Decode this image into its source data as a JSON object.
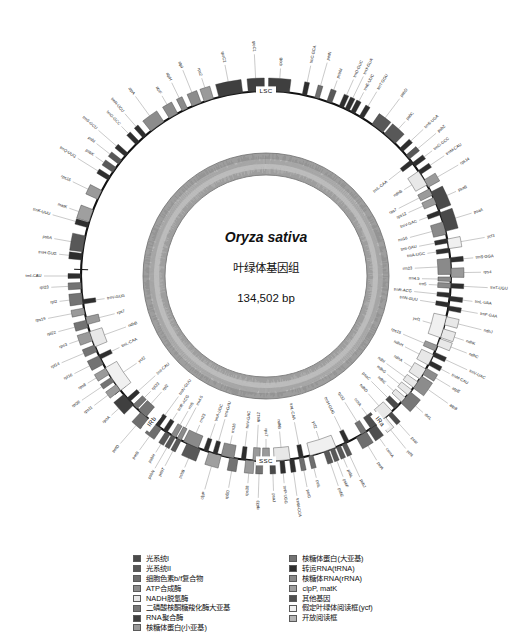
{
  "figure": {
    "species": "Oryza sativa",
    "subtitle": "叶绿体基因组",
    "genome_size": "134,502 bp",
    "regions": [
      {
        "name": "LSC",
        "label": "LSC"
      },
      {
        "name": "SSC",
        "label": "SSC"
      },
      {
        "name": "IRa",
        "label": "IRa"
      },
      {
        "name": "IRb",
        "label": "IRb"
      }
    ]
  },
  "legend": {
    "left": [
      {
        "label": "光系统I",
        "color": "#4a4a4a"
      },
      {
        "label": "光系统II",
        "color": "#585858"
      },
      {
        "label": "细胞色素b/f复合物",
        "color": "#6e6e6e"
      },
      {
        "label": "ATP合成酶",
        "color": "#8c8c8c"
      },
      {
        "label": "NADH脱氢酶",
        "color": "#e8e8e8"
      },
      {
        "label": "二磷酸核酮糖羧化酶大亚基",
        "color": "#777777"
      },
      {
        "label": "RNA聚合酶",
        "color": "#3f3f3f"
      },
      {
        "label": "核糖体蛋白(小亚基)",
        "color": "#9a9a9a"
      }
    ],
    "right": [
      {
        "label": "核糖体蛋白(大亚基)",
        "color": "#737373"
      },
      {
        "label": "转运RNA(tRNA)",
        "color": "#2e2e2e"
      },
      {
        "label": "核糖体RNA(rRNA)",
        "color": "#8a8a8a"
      },
      {
        "label": "clpP, matK",
        "color": "#9f9f9f"
      },
      {
        "label": "其他基因",
        "color": "#4f4f4f"
      },
      {
        "label": "假定叶绿体阅读框(ycf)",
        "color": "#f0f0f0"
      },
      {
        "label": "开放阅读框",
        "color": "#b4b4b4"
      }
    ]
  },
  "chart_data": {
    "type": "circular-genome-map",
    "total_bp": 134502,
    "rings": [
      "gene-track-outer",
      "gene-track-inner",
      "gc-content"
    ],
    "region_boundaries_deg": [
      272,
      104,
      196,
      232
    ],
    "genes_outside": [
      {
        "name": "trnH-GUG",
        "deg": 276,
        "color": "#2e2e2e",
        "w": 2.0
      },
      {
        "name": "psbA",
        "deg": 280,
        "color": "#585858",
        "w": 5.0
      },
      {
        "name": "trnK-UUU",
        "deg": 286,
        "color": "#2e2e2e",
        "w": 1.6
      },
      {
        "name": "matK",
        "deg": 289,
        "color": "#9f9f9f",
        "w": 4.0
      },
      {
        "name": "rps16",
        "deg": 296,
        "color": "#9a9a9a",
        "w": 3.0
      },
      {
        "name": "trnQ-UUG",
        "deg": 302,
        "color": "#2e2e2e",
        "w": 1.4
      },
      {
        "name": "psbK",
        "deg": 305,
        "color": "#585858",
        "w": 1.8
      },
      {
        "name": "psbI",
        "deg": 308,
        "color": "#585858",
        "w": 1.6
      },
      {
        "name": "trnS-GCU",
        "deg": 311,
        "color": "#2e2e2e",
        "w": 1.4
      },
      {
        "name": "trnG-GCC",
        "deg": 316,
        "color": "#2e2e2e",
        "w": 1.4
      },
      {
        "name": "trnR-UCU",
        "deg": 319,
        "color": "#2e2e2e",
        "w": 1.4
      },
      {
        "name": "atpA",
        "deg": 324,
        "color": "#8c8c8c",
        "w": 5.0
      },
      {
        "name": "atpF",
        "deg": 330,
        "color": "#8c8c8c",
        "w": 3.0
      },
      {
        "name": "atpH",
        "deg": 334,
        "color": "#8c8c8c",
        "w": 1.8
      },
      {
        "name": "atpI",
        "deg": 338,
        "color": "#8c8c8c",
        "w": 3.0
      },
      {
        "name": "rps2",
        "deg": 342,
        "color": "#9a9a9a",
        "w": 3.0
      },
      {
        "name": "rpoC2",
        "deg": 349,
        "color": "#3f3f3f",
        "w": 7.5
      },
      {
        "name": "rpoC1",
        "deg": 357,
        "color": "#3f3f3f",
        "w": 5.0
      },
      {
        "name": "rpoB",
        "deg": 4,
        "color": "#3f3f3f",
        "w": 6.5
      },
      {
        "name": "trnC-GCA",
        "deg": 12,
        "color": "#2e2e2e",
        "w": 1.4
      },
      {
        "name": "petN",
        "deg": 16,
        "color": "#6e6e6e",
        "w": 1.4
      },
      {
        "name": "psbM",
        "deg": 20,
        "color": "#585858",
        "w": 1.6
      },
      {
        "name": "trnD-GUC",
        "deg": 24,
        "color": "#2e2e2e",
        "w": 1.4
      },
      {
        "name": "trnY-GUA",
        "deg": 26,
        "color": "#2e2e2e",
        "w": 1.4
      },
      {
        "name": "trnE-UUC",
        "deg": 28,
        "color": "#2e2e2e",
        "w": 1.4
      },
      {
        "name": "trnT-GGU",
        "deg": 31,
        "color": "#2e2e2e",
        "w": 1.4
      },
      {
        "name": "psbD",
        "deg": 37,
        "color": "#585858",
        "w": 4.2
      },
      {
        "name": "psbC",
        "deg": 42,
        "color": "#585858",
        "w": 4.5
      },
      {
        "name": "trnS-UGA",
        "deg": 47,
        "color": "#2e2e2e",
        "w": 1.4
      },
      {
        "name": "psbZ",
        "deg": 50,
        "color": "#585858",
        "w": 1.6
      },
      {
        "name": "trnG-GCC",
        "deg": 53,
        "color": "#2e2e2e",
        "w": 1.4
      },
      {
        "name": "trnM-CAU",
        "deg": 56,
        "color": "#2e2e2e",
        "w": 1.4
      },
      {
        "name": "rps14",
        "deg": 60,
        "color": "#9a9a9a",
        "w": 2.6
      },
      {
        "name": "psaB",
        "deg": 66,
        "color": "#4a4a4a",
        "w": 6.0
      },
      {
        "name": "psaA",
        "deg": 73,
        "color": "#4a4a4a",
        "w": 6.0
      },
      {
        "name": "ycf3",
        "deg": 80,
        "color": "#f0f0f0",
        "w": 3.0
      },
      {
        "name": "trnS-GGA",
        "deg": 85,
        "color": "#2e2e2e",
        "w": 1.4
      },
      {
        "name": "rps4",
        "deg": 89,
        "color": "#9a9a9a",
        "w": 2.8
      },
      {
        "name": "trnT-UGU",
        "deg": 93,
        "color": "#2e2e2e",
        "w": 1.4
      },
      {
        "name": "trnL-UAA",
        "deg": 97,
        "color": "#2e2e2e",
        "w": 1.4
      },
      {
        "name": "trnF-GAA",
        "deg": 100,
        "color": "#2e2e2e",
        "w": 1.4
      },
      {
        "name": "ndhJ",
        "deg": 104,
        "color": "#e8e8e8",
        "w": 2.6
      },
      {
        "name": "ndhK",
        "deg": 108,
        "color": "#e8e8e8",
        "w": 2.8
      },
      {
        "name": "ndhC",
        "deg": 111,
        "color": "#e8e8e8",
        "w": 2.4
      },
      {
        "name": "trnV-UAC",
        "deg": 115,
        "color": "#2e2e2e",
        "w": 1.4
      },
      {
        "name": "trnM-CAU",
        "deg": 118,
        "color": "#2e2e2e",
        "w": 1.4
      },
      {
        "name": "atpE",
        "deg": 121,
        "color": "#8c8c8c",
        "w": 2.2
      },
      {
        "name": "atpB",
        "deg": 125,
        "color": "#8c8c8c",
        "w": 4.5
      },
      {
        "name": "rbcL",
        "deg": 131,
        "color": "#777777",
        "w": 4.5
      },
      {
        "name": "psaI",
        "deg": 138,
        "color": "#4a4a4a",
        "w": 1.4
      },
      {
        "name": "ycf4",
        "deg": 141,
        "color": "#f0f0f0",
        "w": 2.4
      },
      {
        "name": "cemA",
        "deg": 145,
        "color": "#4f4f4f",
        "w": 2.8
      },
      {
        "name": "petA",
        "deg": 149,
        "color": "#6e6e6e",
        "w": 3.6
      },
      {
        "name": "psbJ",
        "deg": 155,
        "color": "#585858",
        "w": 1.4
      },
      {
        "name": "psbL",
        "deg": 157,
        "color": "#585858",
        "w": 1.4
      },
      {
        "name": "psbF",
        "deg": 159,
        "color": "#585858",
        "w": 1.4
      },
      {
        "name": "psbE",
        "deg": 161,
        "color": "#585858",
        "w": 1.6
      },
      {
        "name": "petL",
        "deg": 166,
        "color": "#6e6e6e",
        "w": 1.4
      },
      {
        "name": "petG",
        "deg": 169,
        "color": "#6e6e6e",
        "w": 1.4
      },
      {
        "name": "trnW-CCA",
        "deg": 172,
        "color": "#2e2e2e",
        "w": 1.4
      },
      {
        "name": "trnP-UGG",
        "deg": 175,
        "color": "#2e2e2e",
        "w": 1.4
      },
      {
        "name": "psaJ",
        "deg": 178,
        "color": "#4a4a4a",
        "w": 1.6
      },
      {
        "name": "rpl33",
        "deg": 182,
        "color": "#737373",
        "w": 2.0
      },
      {
        "name": "rps18",
        "deg": 185,
        "color": "#9a9a9a",
        "w": 2.6
      },
      {
        "name": "rpl20",
        "deg": 190,
        "color": "#737373",
        "w": 2.6
      },
      {
        "name": "clpP",
        "deg": 196,
        "color": "#9f9f9f",
        "w": 4.0
      },
      {
        "name": "psbB",
        "deg": 203,
        "color": "#585858",
        "w": 4.5
      },
      {
        "name": "psbT",
        "deg": 208,
        "color": "#585858",
        "w": 1.4
      },
      {
        "name": "psbN",
        "deg": 210,
        "color": "#585858",
        "w": 1.4
      },
      {
        "name": "psbH",
        "deg": 212,
        "color": "#585858",
        "w": 1.6
      },
      {
        "name": "petB",
        "deg": 216,
        "color": "#6e6e6e",
        "w": 3.2
      },
      {
        "name": "petD",
        "deg": 221,
        "color": "#6e6e6e",
        "w": 3.2
      },
      {
        "name": "rpoA",
        "deg": 228,
        "color": "#3f3f3f",
        "w": 4.5
      },
      {
        "name": "rps11",
        "deg": 233,
        "color": "#9a9a9a",
        "w": 2.2
      },
      {
        "name": "rpl36",
        "deg": 236,
        "color": "#737373",
        "w": 1.6
      },
      {
        "name": "rps8",
        "deg": 239,
        "color": "#9a9a9a",
        "w": 2.2
      },
      {
        "name": "rpl16",
        "deg": 243,
        "color": "#737373",
        "w": 3.0
      },
      {
        "name": "rpl14",
        "deg": 247,
        "color": "#737373",
        "w": 2.2
      },
      {
        "name": "rps3",
        "deg": 251,
        "color": "#9a9a9a",
        "w": 3.0
      },
      {
        "name": "rpl22",
        "deg": 255,
        "color": "#737373",
        "w": 2.4
      },
      {
        "name": "rps19",
        "deg": 259,
        "color": "#9a9a9a",
        "w": 2.0
      },
      {
        "name": "rpl2",
        "deg": 263,
        "color": "#737373",
        "w": 3.4
      },
      {
        "name": "rpl23",
        "deg": 267,
        "color": "#737373",
        "w": 2.0
      },
      {
        "name": "trnI-CAU",
        "deg": 270,
        "color": "#2e2e2e",
        "w": 1.4
      }
    ],
    "genes_inside": [
      {
        "name": "trnV-GUG",
        "deg": 262,
        "color": "#2e2e2e",
        "w": 1.4
      },
      {
        "name": "rps7",
        "deg": 256,
        "color": "#9a9a9a",
        "w": 2.4
      },
      {
        "name": "ndhB",
        "deg": 250,
        "color": "#e8e8e8",
        "w": 5.0
      },
      {
        "name": "trnL-CAA",
        "deg": 244,
        "color": "#2e2e2e",
        "w": 1.4
      },
      {
        "name": "ycf2",
        "deg": 236,
        "color": "#f0f0f0",
        "w": 8.5
      },
      {
        "name": "trnI-CAU",
        "deg": 228,
        "color": "#2e2e2e",
        "w": 1.4
      },
      {
        "name": "rpl23",
        "deg": 225,
        "color": "#737373",
        "w": 1.8
      },
      {
        "name": "rpl2",
        "deg": 222,
        "color": "#737373",
        "w": 3.2
      },
      {
        "name": "trnN-GUU",
        "deg": 216,
        "color": "#2e2e2e",
        "w": 1.4
      },
      {
        "name": "trnR-ACG",
        "deg": 213,
        "color": "#2e2e2e",
        "w": 1.4
      },
      {
        "name": "rrn5",
        "deg": 210,
        "color": "#8a8a8a",
        "w": 1.6
      },
      {
        "name": "rrn4.5",
        "deg": 208,
        "color": "#8a8a8a",
        "w": 1.4
      },
      {
        "name": "rrn23",
        "deg": 204,
        "color": "#8a8a8a",
        "w": 5.0
      },
      {
        "name": "trnA-UGC",
        "deg": 199,
        "color": "#2e2e2e",
        "w": 1.4
      },
      {
        "name": "trnI-GAU",
        "deg": 196,
        "color": "#2e2e2e",
        "w": 1.4
      },
      {
        "name": "rrn16",
        "deg": 192,
        "color": "#8a8a8a",
        "w": 4.0
      },
      {
        "name": "trnV-GAC",
        "deg": 187,
        "color": "#2e2e2e",
        "w": 1.4
      },
      {
        "name": "rps12",
        "deg": 183,
        "color": "#9a9a9a",
        "w": 2.2
      },
      {
        "name": "rps7",
        "deg": 180,
        "color": "#9a9a9a",
        "w": 2.2
      },
      {
        "name": "ndhB",
        "deg": 175,
        "color": "#e8e8e8",
        "w": 5.0
      },
      {
        "name": "trnL-CAA",
        "deg": 169,
        "color": "#2e2e2e",
        "w": 1.4
      },
      {
        "name": "ycf2",
        "deg": 162,
        "color": "#f0f0f0",
        "w": 8.5
      },
      {
        "name": "trnH-GUG",
        "deg": 154,
        "color": "#2e2e2e",
        "w": 1.4
      },
      {
        "name": "rpl32",
        "deg": 148,
        "color": "#737373",
        "w": 1.8
      },
      {
        "name": "ccsA",
        "deg": 144,
        "color": "#4f4f4f",
        "w": 3.0
      },
      {
        "name": "ndhD",
        "deg": 139,
        "color": "#e8e8e8",
        "w": 4.0
      },
      {
        "name": "psaC",
        "deg": 135,
        "color": "#4a4a4a",
        "w": 1.8
      },
      {
        "name": "ndhE",
        "deg": 132,
        "color": "#e8e8e8",
        "w": 1.8
      },
      {
        "name": "ndhG",
        "deg": 129,
        "color": "#e8e8e8",
        "w": 2.0
      },
      {
        "name": "ndhI",
        "deg": 126,
        "color": "#e8e8e8",
        "w": 2.2
      },
      {
        "name": "ndhA",
        "deg": 122,
        "color": "#e8e8e8",
        "w": 3.6
      },
      {
        "name": "ndhH",
        "deg": 117,
        "color": "#e8e8e8",
        "w": 3.6
      },
      {
        "name": "rps15",
        "deg": 113,
        "color": "#9a9a9a",
        "w": 1.8
      },
      {
        "name": "ycf1",
        "deg": 106,
        "color": "#f0f0f0",
        "w": 7.0
      },
      {
        "name": "trnN-GUU",
        "deg": 99,
        "color": "#2e2e2e",
        "w": 1.4
      },
      {
        "name": "trnR-ACG",
        "deg": 96,
        "color": "#2e2e2e",
        "w": 1.4
      },
      {
        "name": "rrn5",
        "deg": 93,
        "color": "#8a8a8a",
        "w": 1.6
      },
      {
        "name": "rrn4.5",
        "deg": 91,
        "color": "#8a8a8a",
        "w": 1.4
      },
      {
        "name": "rrn23",
        "deg": 87,
        "color": "#8a8a8a",
        "w": 5.0
      },
      {
        "name": "trnA-UGC",
        "deg": 82,
        "color": "#2e2e2e",
        "w": 1.4
      },
      {
        "name": "trnI-GAU",
        "deg": 79,
        "color": "#2e2e2e",
        "w": 1.4
      },
      {
        "name": "rrn16",
        "deg": 75,
        "color": "#8a8a8a",
        "w": 4.0
      },
      {
        "name": "trnV-GAC",
        "deg": 70,
        "color": "#2e2e2e",
        "w": 1.4
      },
      {
        "name": "rps12",
        "deg": 66,
        "color": "#9a9a9a",
        "w": 2.2
      },
      {
        "name": "rps7",
        "deg": 63,
        "color": "#9a9a9a",
        "w": 2.2
      },
      {
        "name": "ndhB",
        "deg": 58,
        "color": "#e8e8e8",
        "w": 5.0
      },
      {
        "name": "trnL-CAA",
        "deg": 52,
        "color": "#2e2e2e",
        "w": 1.4
      }
    ]
  }
}
